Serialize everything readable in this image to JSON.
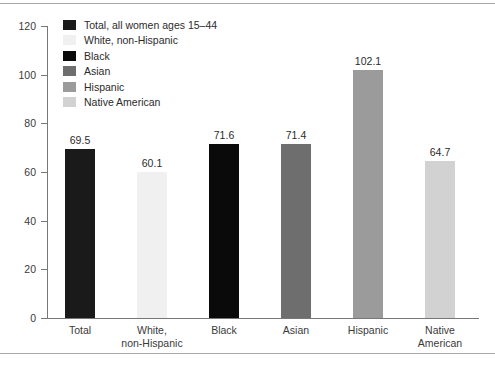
{
  "chart_data": {
    "type": "bar",
    "title": "",
    "subtitle": "",
    "xlabel": "",
    "ylabel": "",
    "ylim": [
      0,
      120
    ],
    "ytick_values": [
      0,
      20,
      40,
      60,
      80,
      100,
      120
    ],
    "ytick_labels": [
      "0",
      "20",
      "40",
      "60",
      "80",
      "100",
      "120"
    ],
    "grid": false,
    "legend_position": "upper-left",
    "categories": [
      "Total",
      "White,\nnon-Hispanic",
      "Black",
      "Asian",
      "Hispanic",
      "Native\nAmerican"
    ],
    "values": [
      69.5,
      60.1,
      71.6,
      71.4,
      102.1,
      64.7
    ],
    "value_labels": [
      "69.5",
      "60.1",
      "71.6",
      "71.4",
      "102.1",
      "64.7"
    ],
    "bars": [
      {
        "category_line1": "Total",
        "category_line2": "",
        "value": 69.5,
        "value_label": "69.5",
        "color": "#1a1a1a"
      },
      {
        "category_line1": "White,",
        "category_line2": "non-Hispanic",
        "value": 60.1,
        "value_label": "60.1",
        "color": "#f0f0f0"
      },
      {
        "category_line1": "Black",
        "category_line2": "",
        "value": 71.6,
        "value_label": "71.6",
        "color": "#0a0a0a"
      },
      {
        "category_line1": "Asian",
        "category_line2": "",
        "value": 71.4,
        "value_label": "71.4",
        "color": "#6e6e6e"
      },
      {
        "category_line1": "Hispanic",
        "category_line2": "",
        "value": 102.1,
        "value_label": "102.1",
        "color": "#9b9b9b"
      },
      {
        "category_line1": "Native",
        "category_line2": "American",
        "value": 64.7,
        "value_label": "64.7",
        "color": "#d2d2d2"
      }
    ],
    "legend": [
      {
        "label": "Total, all women ages 15–44",
        "color": "#1a1a1a"
      },
      {
        "label": "White, non-Hispanic",
        "color": "#f0f0f0"
      },
      {
        "label": "Black",
        "color": "#0a0a0a"
      },
      {
        "label": "Asian",
        "color": "#6e6e6e"
      },
      {
        "label": "Hispanic",
        "color": "#9b9b9b"
      },
      {
        "label": "Native American",
        "color": "#d2d2d2"
      }
    ]
  },
  "axis": {
    "line_color": "#777777",
    "tick_color": "#777777"
  },
  "frame": {
    "rule_color": "#a8a8a8"
  }
}
